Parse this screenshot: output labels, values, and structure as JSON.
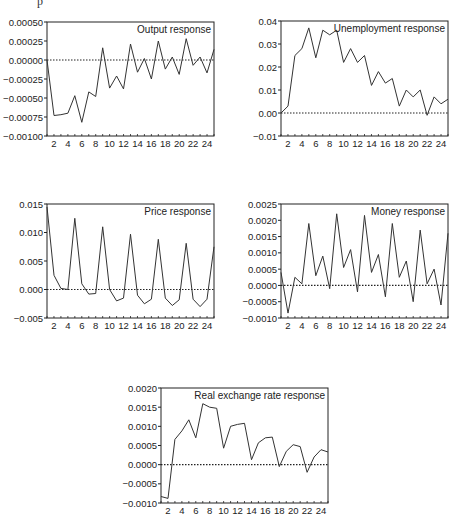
{
  "page": {
    "top_fragment": "p"
  },
  "chart_data": [
    {
      "id": "output",
      "type": "line",
      "title": "Output response",
      "xlabel": "",
      "ylabel": "",
      "x": [
        1,
        2,
        3,
        4,
        5,
        6,
        7,
        8,
        9,
        10,
        11,
        12,
        13,
        14,
        15,
        16,
        17,
        18,
        19,
        20,
        21,
        22,
        23,
        24,
        25
      ],
      "values": [
        0.0,
        -0.00073,
        -0.00072,
        -0.0007,
        -0.00047,
        -0.00082,
        -0.00042,
        -0.00048,
        0.00016,
        -0.00037,
        -0.00021,
        -0.00038,
        0.00021,
        -0.00016,
        2e-05,
        -0.00025,
        0.00025,
        -0.00012,
        4e-05,
        -0.00019,
        0.00028,
        -7e-05,
        4e-05,
        -0.00017,
        0.00014
      ],
      "ylim": [
        -0.001,
        0.0005
      ],
      "yticks": [
        -0.001,
        -0.00075,
        -0.0005,
        -0.00025,
        0.0,
        0.00025,
        0.0005
      ],
      "ytick_labels": [
        "-0.00100",
        "-0.00075",
        "-0.00050",
        "-0.00025",
        "0.00000",
        "0.00025",
        "0.00050"
      ],
      "xticks": [
        2,
        4,
        6,
        8,
        10,
        12,
        14,
        16,
        18,
        20,
        22,
        24
      ],
      "zero_line": "dotted",
      "legend_position": "top-right",
      "frame": {
        "x": 47,
        "y": 22,
        "w": 167,
        "h": 114
      }
    },
    {
      "id": "unemployment",
      "type": "line",
      "title": "Unemployment response",
      "xlabel": "",
      "ylabel": "",
      "x": [
        1,
        2,
        3,
        4,
        5,
        6,
        7,
        8,
        9,
        10,
        11,
        12,
        13,
        14,
        15,
        16,
        17,
        18,
        19,
        20,
        21,
        22,
        23,
        24,
        25
      ],
      "values": [
        0.0,
        0.003,
        0.025,
        0.028,
        0.037,
        0.024,
        0.036,
        0.034,
        0.036,
        0.022,
        0.028,
        0.022,
        0.025,
        0.012,
        0.018,
        0.013,
        0.015,
        0.003,
        0.01,
        0.007,
        0.01,
        -0.001,
        0.007,
        0.004,
        0.006
      ],
      "ylim": [
        -0.01,
        0.04
      ],
      "yticks": [
        -0.01,
        0.0,
        0.01,
        0.02,
        0.03,
        0.04
      ],
      "ytick_labels": [
        "-0.01",
        "0.00",
        "0.01",
        "0.02",
        "0.03",
        "0.04"
      ],
      "xticks": [
        2,
        4,
        6,
        8,
        10,
        12,
        14,
        16,
        18,
        20,
        22,
        24
      ],
      "zero_line": "dotted",
      "legend_position": "top-right",
      "frame": {
        "x": 281,
        "y": 21,
        "w": 167,
        "h": 115
      }
    },
    {
      "id": "price",
      "type": "line",
      "title": "Price response",
      "xlabel": "",
      "ylabel": "",
      "x": [
        1,
        2,
        3,
        4,
        5,
        6,
        7,
        8,
        9,
        10,
        11,
        12,
        13,
        14,
        15,
        16,
        17,
        18,
        19,
        20,
        21,
        22,
        23,
        24,
        25
      ],
      "values": [
        0.0145,
        0.0025,
        0.0002,
        0.0,
        0.0125,
        0.001,
        -0.0008,
        -0.0007,
        0.011,
        0.0,
        -0.002,
        -0.0015,
        0.0097,
        -0.001,
        -0.0025,
        -0.0017,
        0.0088,
        -0.0015,
        -0.0028,
        -0.0018,
        0.0081,
        -0.0017,
        -0.003,
        -0.0017,
        0.0075
      ],
      "ylim": [
        -0.005,
        0.015
      ],
      "yticks": [
        -0.005,
        0.0,
        0.005,
        0.01,
        0.015
      ],
      "ytick_labels": [
        "-0.005",
        "0.000",
        "0.005",
        "0.010",
        "0.015"
      ],
      "xticks": [
        2,
        4,
        6,
        8,
        10,
        12,
        14,
        16,
        18,
        20,
        22,
        24
      ],
      "zero_line": "dotted",
      "legend_position": "top-right",
      "frame": {
        "x": 47,
        "y": 204,
        "w": 167,
        "h": 114
      }
    },
    {
      "id": "money",
      "type": "line",
      "title": "Money response",
      "xlabel": "",
      "ylabel": "",
      "x": [
        1,
        2,
        3,
        4,
        5,
        6,
        7,
        8,
        9,
        10,
        11,
        12,
        13,
        14,
        15,
        16,
        17,
        18,
        19,
        20,
        21,
        22,
        23,
        24,
        25
      ],
      "values": [
        0.0004,
        -0.00085,
        0.00025,
        5e-05,
        0.0019,
        0.0003,
        0.0009,
        -0.0001,
        0.0022,
        0.00055,
        0.0011,
        -0.0002,
        0.00215,
        0.0004,
        0.00095,
        -0.00035,
        0.0019,
        0.00025,
        0.00075,
        -0.0005,
        0.0017,
        5e-05,
        0.0005,
        -0.0006,
        0.0016
      ],
      "ylim": [
        -0.001,
        0.0025
      ],
      "yticks": [
        -0.001,
        -0.0005,
        0.0,
        0.0005,
        0.001,
        0.0015,
        0.002,
        0.0025
      ],
      "ytick_labels": [
        "-0.0010",
        "-0.0005",
        "0.0000",
        "0.0005",
        "0.0010",
        "0.0015",
        "0.0020",
        "0.0025"
      ],
      "xticks": [
        2,
        4,
        6,
        8,
        10,
        12,
        14,
        16,
        18,
        20,
        22,
        24
      ],
      "zero_line": "dotted",
      "legend_position": "top-right",
      "frame": {
        "x": 281,
        "y": 204,
        "w": 167,
        "h": 114
      }
    },
    {
      "id": "real-exchange-rate",
      "type": "line",
      "title": "Real exchange rate response",
      "xlabel": "",
      "ylabel": "",
      "x": [
        1,
        2,
        3,
        4,
        5,
        6,
        7,
        8,
        9,
        10,
        11,
        12,
        13,
        14,
        15,
        16,
        17,
        18,
        19,
        20,
        21,
        22,
        23,
        24,
        25
      ],
      "values": [
        -0.00083,
        -0.00088,
        0.00066,
        0.00088,
        0.00117,
        0.0007,
        0.00159,
        0.0015,
        0.00147,
        0.00043,
        0.001,
        0.00105,
        0.00108,
        0.00013,
        0.00057,
        0.0007,
        0.00072,
        -5e-05,
        0.00035,
        0.00052,
        0.00047,
        -0.0002,
        0.0002,
        0.00039,
        0.00033
      ],
      "ylim": [
        -0.001,
        0.002
      ],
      "yticks": [
        -0.001,
        -0.0005,
        0.0,
        0.0005,
        0.001,
        0.0015,
        0.002
      ],
      "ytick_labels": [
        "-0.0010",
        "-0.0005",
        "0.0000",
        "0.0005",
        "0.0010",
        "0.0015",
        "0.0020"
      ],
      "xticks": [
        2,
        4,
        6,
        8,
        10,
        12,
        14,
        16,
        18,
        20,
        22,
        24
      ],
      "zero_line": "dotted",
      "legend_position": "top-right",
      "frame": {
        "x": 161,
        "y": 388,
        "w": 167,
        "h": 115
      }
    }
  ],
  "style": {
    "line_color": "#333333",
    "frame_color": "#222222",
    "text_color": "#222222",
    "background": "#ffffff"
  }
}
